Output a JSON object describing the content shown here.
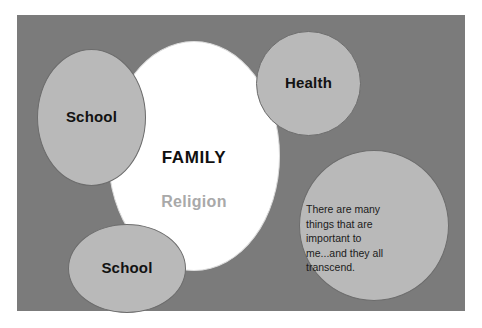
{
  "diagram": {
    "background_color": "#7b7b7b",
    "bubble_fill_color": "#b9b9b9",
    "center_fill_color": "#ffffff",
    "center": {
      "primary_label": "FAMILY",
      "secondary_label": "Religion",
      "secondary_color": "#a9a9a9"
    },
    "bubbles": [
      {
        "id": "school-top",
        "label": "School"
      },
      {
        "id": "health",
        "label": "Health"
      },
      {
        "id": "school-bottom",
        "label": "School"
      },
      {
        "id": "quote",
        "label": "There are many things that are important to me...and they all transcend."
      }
    ]
  }
}
